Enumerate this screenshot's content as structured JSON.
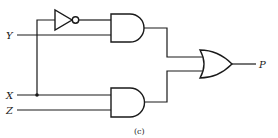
{
  "diagram": {
    "type": "logic-circuit",
    "caption": "(c)",
    "inputs": [
      {
        "id": "Y",
        "label": "Y"
      },
      {
        "id": "X",
        "label": "X"
      },
      {
        "id": "Z",
        "label": "Z"
      }
    ],
    "outputs": [
      {
        "id": "P",
        "label": "P"
      }
    ],
    "gates": [
      {
        "id": "not1",
        "type": "NOT",
        "inputs": [
          "X"
        ]
      },
      {
        "id": "and1",
        "type": "AND",
        "inputs": [
          "not1",
          "Y"
        ]
      },
      {
        "id": "and2",
        "type": "AND",
        "inputs": [
          "X",
          "Z"
        ]
      },
      {
        "id": "or1",
        "type": "OR",
        "inputs": [
          "and1",
          "and2"
        ],
        "output": "P"
      }
    ],
    "expression": "P = X'Y + XZ",
    "colors": {
      "line": "#1a1a1a",
      "background": "#ffffff"
    }
  }
}
